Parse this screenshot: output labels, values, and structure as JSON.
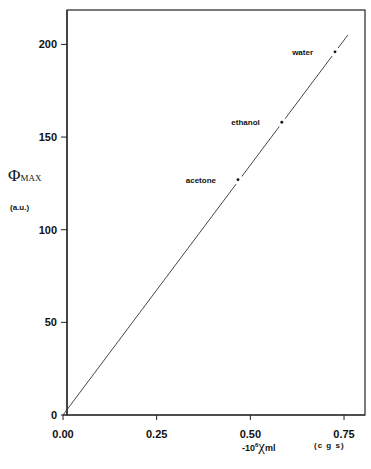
{
  "chart_data": {
    "type": "line",
    "title": "",
    "xlabel": "-10^6 χ_ml",
    "xlabel_parts": {
      "prefix": "-10",
      "exp": "6",
      "symbol": "χ",
      "sub": "ml"
    },
    "xunits": "(c g s)",
    "ylabel": "Φ_MAX",
    "ylabel_parts": {
      "symbol": "Φ",
      "sub": "MAX"
    },
    "yunits": "(a.u.)",
    "xlim": [
      0,
      0.8
    ],
    "ylim": [
      0,
      215
    ],
    "xticks": [
      0.0,
      0.25,
      0.5,
      0.75
    ],
    "xtick_labels": [
      "0.00",
      "0.25",
      "0.50",
      "0.75"
    ],
    "yticks": [
      0,
      50,
      100,
      150,
      200
    ],
    "ytick_labels": [
      "0",
      "50",
      "100",
      "150",
      "200"
    ],
    "grid": false,
    "legend": "none",
    "series": [
      {
        "name": "fit line",
        "style": "solid thin line through origin",
        "x": [
          0.0,
          0.76
        ],
        "y": [
          0,
          205
        ]
      },
      {
        "name": "solvents",
        "style": "points",
        "points": [
          {
            "label": "acetone",
            "x": 0.467,
            "y": 127
          },
          {
            "label": "ethanol",
            "x": 0.584,
            "y": 158
          },
          {
            "label": "water",
            "x": 0.726,
            "y": 196
          }
        ]
      }
    ]
  }
}
